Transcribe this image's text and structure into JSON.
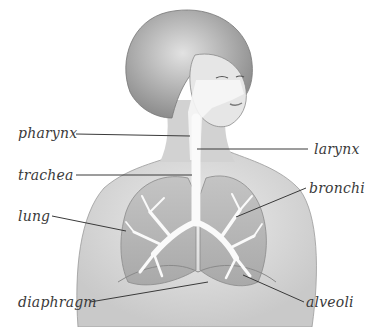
{
  "diagram": {
    "labels": [
      {
        "id": "pharynx",
        "text": "pharynx",
        "x": 18,
        "y": 125,
        "target": [
          190,
          136
        ]
      },
      {
        "id": "larynx",
        "text": "larynx",
        "x": 314,
        "y": 141,
        "target": [
          197,
          149
        ]
      },
      {
        "id": "trachea",
        "text": "trachea",
        "x": 18,
        "y": 167,
        "target": [
          192,
          175
        ]
      },
      {
        "id": "bronchi",
        "text": "bronchi",
        "x": 309,
        "y": 180,
        "target": [
          236,
          217
        ]
      },
      {
        "id": "lung",
        "text": "lung",
        "x": 18,
        "y": 208,
        "target": [
          126,
          231
        ]
      },
      {
        "id": "diaphragm",
        "text": "diaphragm",
        "x": 18,
        "y": 294,
        "target": [
          208,
          282
        ]
      },
      {
        "id": "alveoli",
        "text": "alveoli",
        "x": 306,
        "y": 294,
        "target": [
          243,
          275
        ]
      }
    ],
    "colors": {
      "background": "#ffffff",
      "ink": "#3a3a3a",
      "skin": "#d9d9d9",
      "hair": "#a8a8a8",
      "lung": "#b8b8b8",
      "airway": "#f7f7f7"
    }
  }
}
